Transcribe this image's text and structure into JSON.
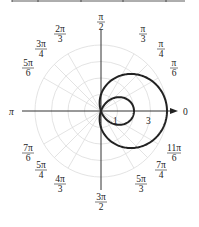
{
  "chart_data": {
    "type": "line",
    "subtype": "polar",
    "title": "",
    "curve": "limaçon with inner loop, r = 1 + 3cos(θ)",
    "equation": "r = 1 + 3cos θ",
    "radial_ticks": [
      "1",
      "3"
    ],
    "radial_range": [
      0,
      4
    ],
    "grid": true,
    "grid_circles": [
      1,
      2,
      3,
      4
    ],
    "angle_labels": [
      {
        "id": "a0",
        "num": "",
        "den": "",
        "text": "0"
      },
      {
        "id": "a30",
        "num": "π",
        "den": "6"
      },
      {
        "id": "a45",
        "num": "π",
        "den": "4"
      },
      {
        "id": "a60",
        "num": "π",
        "den": "3"
      },
      {
        "id": "a90",
        "num": "π",
        "den": "2"
      },
      {
        "id": "a120",
        "num": "2π",
        "den": "3"
      },
      {
        "id": "a135",
        "num": "3π",
        "den": "4"
      },
      {
        "id": "a150",
        "num": "5π",
        "den": "6"
      },
      {
        "id": "a180",
        "num": "",
        "den": "",
        "text": "π"
      },
      {
        "id": "a210",
        "num": "7π",
        "den": "6"
      },
      {
        "id": "a225",
        "num": "5π",
        "den": "4"
      },
      {
        "id": "a240",
        "num": "4π",
        "den": "3"
      },
      {
        "id": "a270",
        "num": "3π",
        "den": "2"
      },
      {
        "id": "a300",
        "num": "5π",
        "den": "3"
      },
      {
        "id": "a315",
        "num": "7π",
        "den": "4"
      },
      {
        "id": "a330",
        "num": "11π",
        "den": "6"
      }
    ],
    "key_points": [
      {
        "theta": "0",
        "r": 4
      },
      {
        "theta": "π/2",
        "r": 1
      },
      {
        "theta": "π",
        "r": -2
      },
      {
        "theta": "3π/2",
        "r": 1
      }
    ]
  },
  "labels": {
    "zero": "0",
    "pi": "π",
    "pi_2": {
      "num": "π",
      "den": "2"
    },
    "pi_3": {
      "num": "π",
      "den": "3"
    },
    "pi_4": {
      "num": "π",
      "den": "4"
    },
    "pi_6": {
      "num": "π",
      "den": "6"
    },
    "two_pi_3": {
      "num": "2π",
      "den": "3"
    },
    "three_pi_4": {
      "num": "3π",
      "den": "4"
    },
    "five_pi_6": {
      "num": "5π",
      "den": "6"
    },
    "seven_pi_6": {
      "num": "7π",
      "den": "6"
    },
    "five_pi_4": {
      "num": "5π",
      "den": "4"
    },
    "four_pi_3": {
      "num": "4π",
      "den": "3"
    },
    "three_pi_2": {
      "num": "3π",
      "den": "2"
    },
    "five_pi_3": {
      "num": "5π",
      "den": "3"
    },
    "seven_pi_4": {
      "num": "7π",
      "den": "4"
    },
    "eleven_pi_6": {
      "num": "11π",
      "den": "6"
    },
    "r1": "1",
    "r3": "3"
  }
}
